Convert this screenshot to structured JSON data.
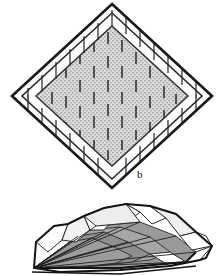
{
  "figure": {
    "caption_label": "b",
    "background_color": "#ffffff",
    "ink_color": "#1a1a1a",
    "panels": [
      {
        "id": "panel-b-plan",
        "name": "nested-diamond-plan-view",
        "description": "Plan view: three nested rotated squares (diamonds) with radial tick marks along the edges and a stippled grey interior bearing vertical dash marks.",
        "label": "b",
        "label_position": {
          "x": 139,
          "y": 176
        },
        "fill_color": "#d2d2d2",
        "stipple_color": "#a8a8a8",
        "dash_color": "#404040",
        "outline_color": "#1f1f1f",
        "diamonds": [
          {
            "name": "outer-diamond",
            "cx": 112,
            "cy": 96,
            "rx": 100,
            "ry": 92,
            "stroke_width": 2.6
          },
          {
            "name": "middle-diamond",
            "cx": 112,
            "cy": 96,
            "rx": 90,
            "ry": 83,
            "stroke_width": 1.5
          },
          {
            "name": "inner-diamond",
            "cx": 112,
            "cy": 96,
            "rx": 76,
            "ry": 70,
            "stroke_width": 1.4
          }
        ],
        "tick_count_per_edge": 9,
        "tick_length": 17,
        "interior_dash_rows": 7,
        "interior_dash_columns": 9
      },
      {
        "id": "panel-b-perspective",
        "name": "faceted-surface-perspective-view",
        "description": "Perspective view of the same structure: a low faceted dome / tent-like surface with radiating fold lines converging at the lower-left apex, shaded grey facets and white facets.",
        "shade_dark": "#8d8d8d",
        "shade_mid": "#a9a9a9",
        "shade_light": "#c6c6c6",
        "shade_white": "#ffffff",
        "outline_color": "#1f1f1f",
        "ray_count": 11
      }
    ]
  }
}
